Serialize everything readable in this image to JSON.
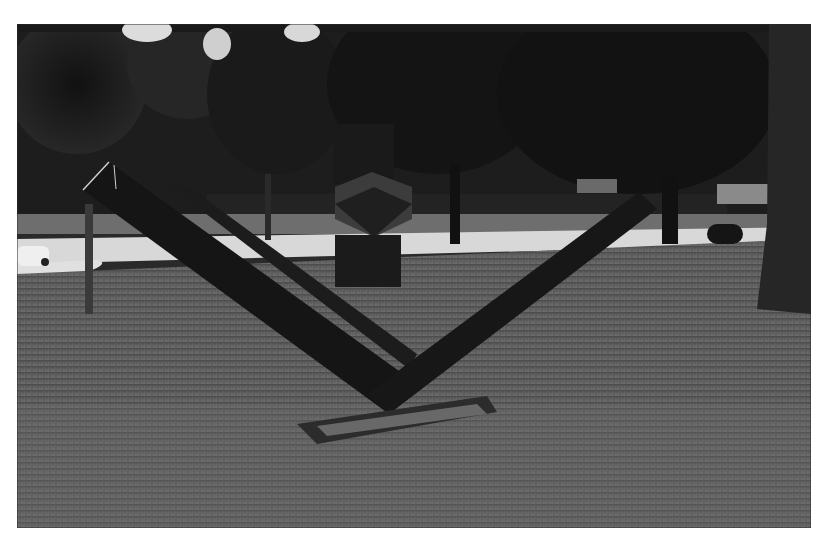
{
  "image": {
    "kind": "black-and-white photograph",
    "subject": "outdoor steel sculpture on lawn",
    "elements": [
      "v-shaped-steel-sculpture",
      "cube-on-pedestal-sculpture",
      "trees",
      "road",
      "grass-lawn",
      "parked-car"
    ]
  },
  "colors": {
    "border": "#ffffff",
    "sky": "#e8e8e8",
    "trees": "#1c1c1c",
    "road": "#d6d6d6",
    "grass": "#5a5a5a",
    "sculpture": "#161616"
  }
}
